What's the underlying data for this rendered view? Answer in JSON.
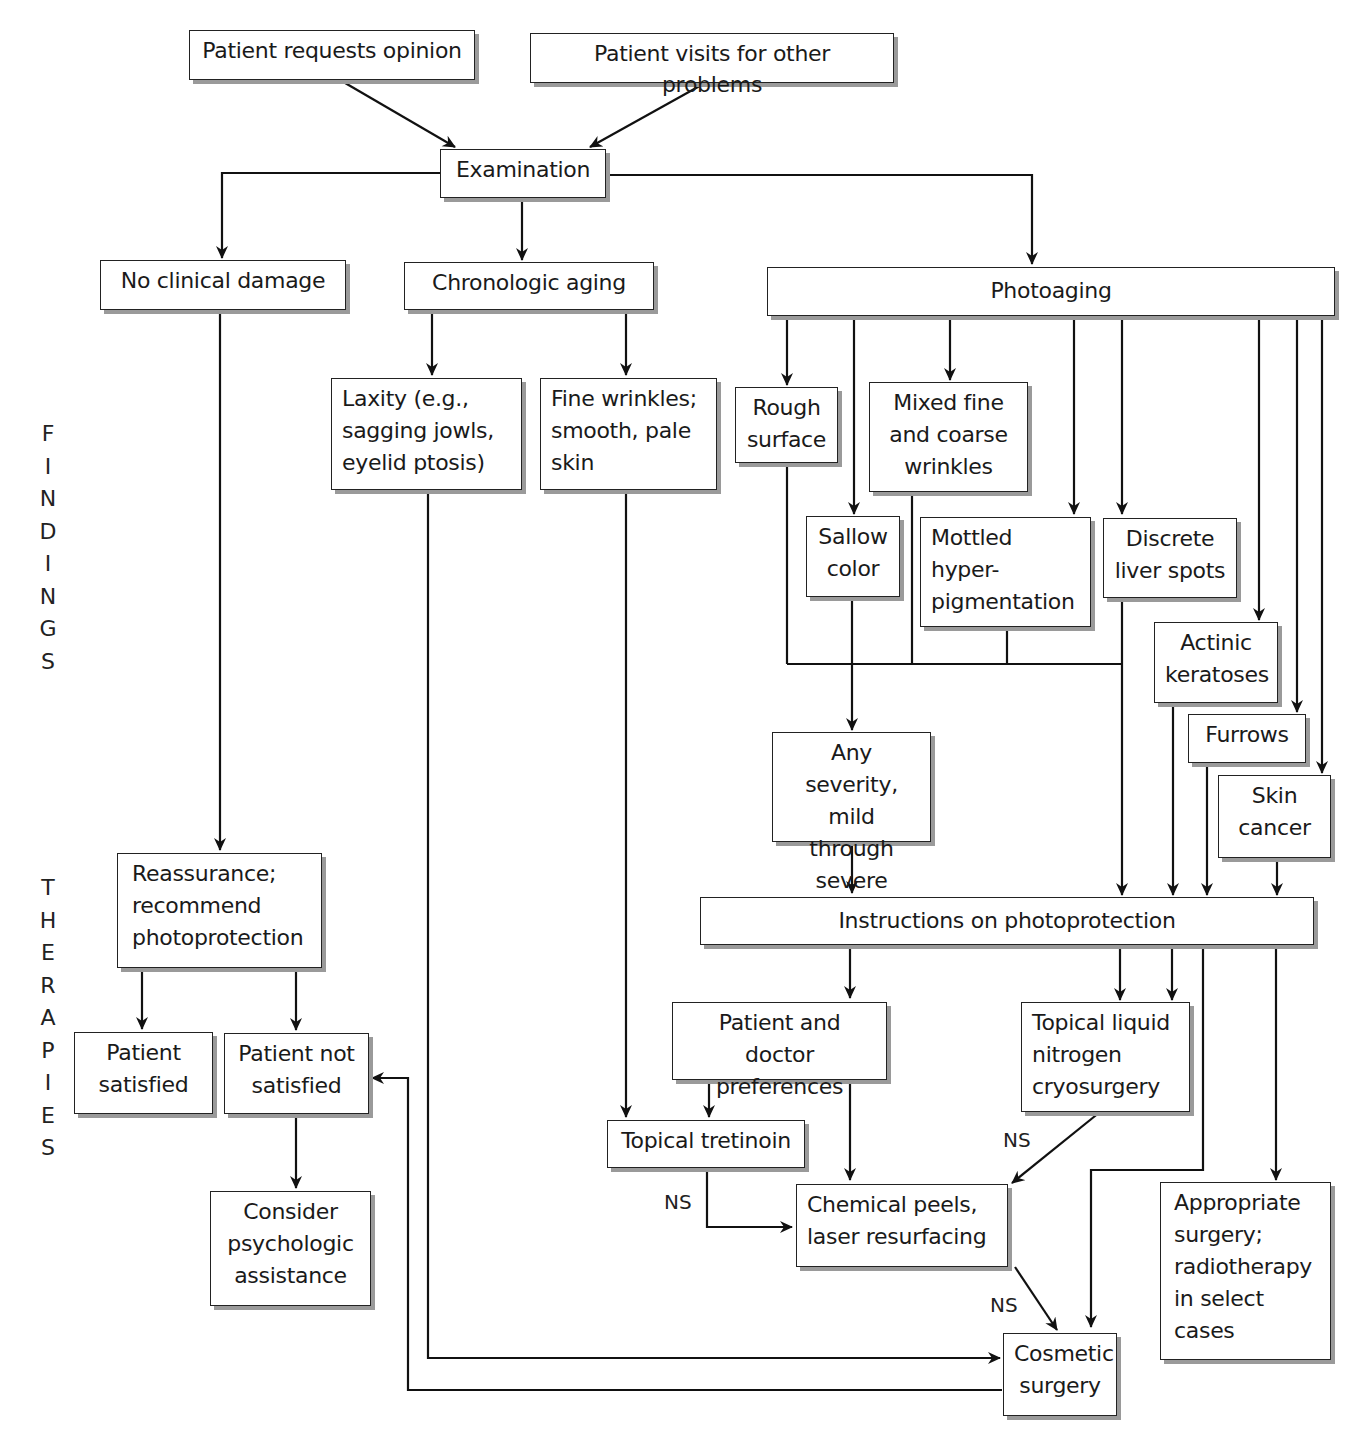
{
  "side_labels": {
    "findings": "F\nI\nN\nD\nI\nN\nG\nS",
    "therapies": "T\nH\nE\nR\nA\nP\nI\nE\nS"
  },
  "nodes": {
    "requests_opinion": "Patient requests opinion",
    "visits_other": "Patient visits for other problems",
    "examination": "Examination",
    "no_damage": "No clinical damage",
    "chronologic": "Chronologic aging",
    "photoaging": "Photoaging",
    "laxity": "Laxity (e.g.,\nsagging jowls,\neyelid ptosis)",
    "fine_wrinkles": "Fine wrinkles;\nsmooth, pale\nskin",
    "rough_surface": "Rough\nsurface",
    "mixed_wrinkles": "Mixed fine\nand coarse\nwrinkles",
    "sallow": "Sallow\ncolor",
    "mottled": "Mottled\nhyper-\npigmentation",
    "liver_spots": "Discrete\nliver spots",
    "actinic": "Actinic\nkeratoses",
    "furrows": "Furrows",
    "skin_cancer": "Skin\ncancer",
    "any_severity": "Any severity,\nmild through\nsevere",
    "reassurance": "Reassurance;\nrecommend\nphotoprotection",
    "instructions": "Instructions on photoprotection",
    "satisfied": "Patient\nsatisfied",
    "not_satisfied": "Patient not\nsatisfied",
    "psych": "Consider\npsychologic\nassistance",
    "preferences": "Patient and doctor\npreferences",
    "cryo": "Topical liquid\nnitrogen\ncryosurgery",
    "tretinoin": "Topical tretinoin",
    "peels": "Chemical peels,\nlaser resurfacing",
    "appropriate_surgery": "Appropriate\nsurgery;\nradiotherapy\nin select\ncases",
    "cosmetic": "Cosmetic\nsurgery"
  },
  "edge_labels": {
    "ns_tretinoin": "NS",
    "ns_cryo": "NS",
    "ns_peels": "NS"
  },
  "colors": {
    "line": "#111111",
    "box_border": "#222222",
    "shadow": "#9a9a9a",
    "background": "#ffffff"
  }
}
